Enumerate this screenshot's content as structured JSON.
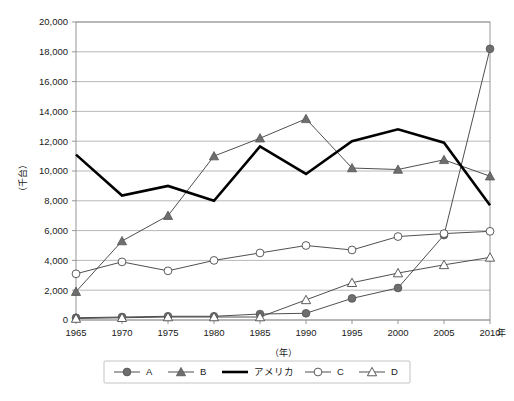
{
  "chart_data": {
    "type": "line",
    "title": "",
    "xlabel": "（年）",
    "ylabel": "（千台）",
    "x_axis_suffix": "年",
    "categories": [
      1965,
      1970,
      1975,
      1980,
      1985,
      1990,
      1995,
      2000,
      2005,
      2010
    ],
    "x_tick_labels": [
      "1965",
      "1970",
      "1975",
      "1980",
      "1985",
      "1990",
      "1995",
      "2000",
      "2005",
      "2010"
    ],
    "y_tick_labels": [
      "0",
      "2,000",
      "4,000",
      "6,000",
      "8,000",
      "10,000",
      "12,000",
      "14,000",
      "16,000",
      "18,000",
      "20,000"
    ],
    "y_tick_values": [
      0,
      2000,
      4000,
      6000,
      8000,
      10000,
      12000,
      14000,
      16000,
      18000,
      20000
    ],
    "ylim": [
      0,
      20000
    ],
    "grid": true,
    "legend_position": "bottom",
    "series": [
      {
        "name": "A",
        "marker": "filled-circle",
        "line_style": "thin",
        "values": [
          150,
          200,
          250,
          250,
          400,
          450,
          1450,
          2150,
          5700,
          18200
        ]
      },
      {
        "name": "B",
        "marker": "filled-triangle",
        "line_style": "thin",
        "values": [
          1900,
          5300,
          7000,
          11000,
          12200,
          13500,
          10200,
          10100,
          10750,
          9650
        ]
      },
      {
        "name": "アメリカ",
        "marker": "none",
        "line_style": "thick",
        "values": [
          11100,
          8350,
          9000,
          8000,
          11650,
          9800,
          12000,
          12800,
          11900,
          7700
        ]
      },
      {
        "name": "C",
        "marker": "open-circle",
        "line_style": "thin",
        "values": [
          3100,
          3900,
          3300,
          4000,
          4500,
          5000,
          4700,
          5600,
          5800,
          5950
        ]
      },
      {
        "name": "D",
        "marker": "open-triangle",
        "line_style": "thin",
        "values": [
          100,
          150,
          200,
          200,
          200,
          1350,
          2500,
          3150,
          3700,
          4200
        ]
      }
    ]
  },
  "legend": {
    "items": [
      {
        "label": "A",
        "marker": "filled-circle"
      },
      {
        "label": "B",
        "marker": "filled-triangle"
      },
      {
        "label": "アメリカ",
        "marker": "none"
      },
      {
        "label": "C",
        "marker": "open-circle"
      },
      {
        "label": "D",
        "marker": "open-triangle"
      }
    ]
  },
  "axis": {
    "y_title": "（千台）",
    "x_title": "（年）",
    "x_unit_right": "年"
  }
}
